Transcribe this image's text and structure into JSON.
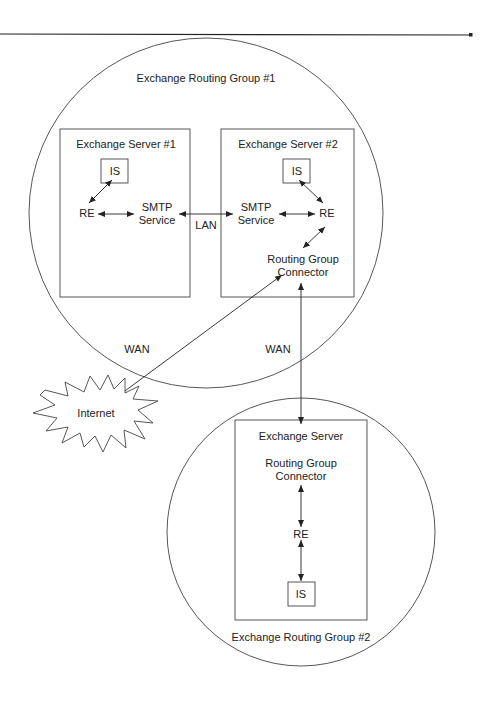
{
  "diagram": {
    "routing_groups": [
      {
        "id": "rg1",
        "label": "Exchange Routing Group #1"
      },
      {
        "id": "rg2",
        "label": "Exchange Routing Group #2"
      }
    ],
    "servers": [
      {
        "id": "s1",
        "label": "Exchange Server #1",
        "is": "IS",
        "re": "RE",
        "smtp_line1": "SMTP",
        "smtp_line2": "Service"
      },
      {
        "id": "s2",
        "label": "Exchange Server #2",
        "is": "IS",
        "re": "RE",
        "smtp_line1": "SMTP",
        "smtp_line2": "Service",
        "rgc_line1": "Routing Group",
        "rgc_line2": "Connector"
      },
      {
        "id": "s3",
        "label": "Exchange Server",
        "is": "IS",
        "re": "RE",
        "rgc_line1": "Routing Group",
        "rgc_line2": "Connector"
      }
    ],
    "links": {
      "lan": "LAN",
      "wan_internet": "WAN",
      "wan_rg": "WAN"
    },
    "internet": "Internet"
  }
}
